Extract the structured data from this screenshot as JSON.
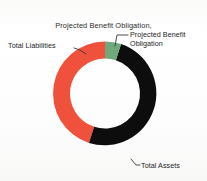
{
  "chart_data": {
    "type": "pie",
    "variant": "donut",
    "title": "Projected Benefit Obligation, (All Sectors)",
    "title_lines": [
      "Projected Benefit Obligation,",
      "(All Sectors)"
    ],
    "xlabel": "",
    "ylabel": "",
    "legend_position": "callout-labels",
    "grid": false,
    "categories": [
      "Projected Benefit Obligation",
      "Total Assets",
      "Total Liabilities"
    ],
    "values": [
      5,
      50,
      45
    ],
    "units": "percent of total",
    "slices": [
      {
        "label": "Projected Benefit Obligation",
        "label_lines": [
          "Projected Benefit",
          "Obligation"
        ],
        "value": 5,
        "color": "#6FA87A",
        "start_angle_deg": 0,
        "end_angle_deg": 18
      },
      {
        "label": "Total Assets",
        "label_lines": [
          "Total Assets"
        ],
        "value": 50,
        "color": "#0D0D0D",
        "start_angle_deg": 18,
        "end_angle_deg": 198
      },
      {
        "label": "Total Liabilities",
        "label_lines": [
          "Total Liabilities"
        ],
        "value": 45,
        "color": "#F0513C",
        "start_angle_deg": 198,
        "end_angle_deg": 360
      }
    ],
    "colors": {
      "projected_benefit_obligation": "#6FA87A",
      "total_assets": "#0D0D0D",
      "total_liabilities": "#F0513C",
      "background": "#FDFDFC",
      "text": "#232323",
      "leader_line": "#3A3A3A"
    }
  },
  "figure": {
    "title_line_1": "Projected Benefit Obligation,",
    "title_line_2": "(All Sectors)",
    "labels": {
      "total_liabilities": "Total Liabilities",
      "pbo_line_1": "Projected Benefit",
      "pbo_line_2": "Obligation",
      "total_assets": "Total Assets"
    }
  }
}
